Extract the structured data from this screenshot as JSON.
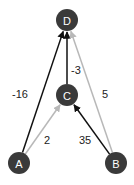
{
  "graph": {
    "node_color": "#3a3a3a",
    "nodes": [
      {
        "id": "D",
        "label": "D",
        "x": 67,
        "y": 20
      },
      {
        "id": "C",
        "label": "C",
        "x": 67,
        "y": 95
      },
      {
        "id": "A",
        "label": "A",
        "x": 19,
        "y": 163
      },
      {
        "id": "B",
        "label": "B",
        "x": 116,
        "y": 163
      }
    ],
    "edges": [
      {
        "from": "A",
        "to": "D",
        "weight": "-16",
        "color": "#111111",
        "label_x": 20,
        "label_y": 94
      },
      {
        "from": "A",
        "to": "C",
        "weight": "2",
        "color": "#b8b8b8",
        "label_x": 47,
        "label_y": 140
      },
      {
        "from": "C",
        "to": "D",
        "weight": "-3",
        "color": "#111111",
        "label_x": 76,
        "label_y": 70
      },
      {
        "from": "B",
        "to": "C",
        "weight": "35",
        "color": "#111111",
        "label_x": 85,
        "label_y": 140
      },
      {
        "from": "B",
        "to": "D",
        "weight": "5",
        "color": "#b8b8b8",
        "label_x": 105,
        "label_y": 94
      }
    ]
  }
}
